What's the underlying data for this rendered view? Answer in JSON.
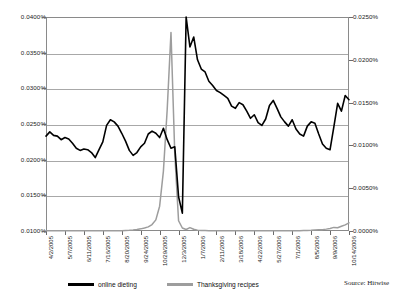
{
  "chart_data": {
    "type": "line",
    "title": "",
    "xlabel": "",
    "ylabel": "",
    "grid": true,
    "legend_position": "bottom",
    "source_note": "Source: Hitwise",
    "x_tick_labels": [
      "4/2/2005",
      "5/7/2005",
      "6/11/2005",
      "7/16/2005",
      "8/20/2005",
      "9/24/2005",
      "10/29/2005",
      "12/3/2005",
      "1/7/2006",
      "2/11/2006",
      "3/18/2006",
      "4/22/2006",
      "5/27/2006",
      "7/1/2006",
      "8/5/2006",
      "9/9/2006",
      "10/14/2006"
    ],
    "left_axis": {
      "label": "",
      "ylim": [
        0.01,
        0.04
      ],
      "tick_labels": [
        "0.0400%",
        "0.0350%",
        "0.0300%",
        "0.0250%",
        "0.0200%",
        "0.0150%",
        "0.0100%"
      ],
      "tick_values": [
        0.04,
        0.035,
        0.03,
        0.025,
        0.02,
        0.015,
        0.01
      ]
    },
    "right_axis": {
      "label": "",
      "ylim": [
        0.0,
        0.025
      ],
      "tick_labels": [
        "0.0250%",
        "0.0200%",
        "0.0150%",
        "0.0100%",
        "0.0050%",
        "0.0000%"
      ],
      "tick_values": [
        0.025,
        0.02,
        0.015,
        0.01,
        0.005,
        0.0
      ]
    },
    "series": [
      {
        "name": "online dieting",
        "color": "#000000",
        "axis": "left",
        "unit": "%",
        "x": [
          "4/2/2005",
          "4/9/2005",
          "4/16/2005",
          "4/23/2005",
          "4/30/2005",
          "5/7/2005",
          "5/14/2005",
          "5/21/2005",
          "5/28/2005",
          "6/4/2005",
          "6/11/2005",
          "6/18/2005",
          "6/25/2005",
          "7/2/2005",
          "7/9/2005",
          "7/16/2005",
          "7/23/2005",
          "7/30/2005",
          "8/6/2005",
          "8/13/2005",
          "8/20/2005",
          "8/27/2005",
          "9/3/2005",
          "9/10/2005",
          "9/17/2005",
          "9/24/2005",
          "10/1/2005",
          "10/8/2005",
          "10/15/2005",
          "10/22/2005",
          "10/29/2005",
          "11/5/2005",
          "11/12/2005",
          "11/19/2005",
          "11/26/2005",
          "12/3/2005",
          "12/10/2005",
          "12/17/2005",
          "12/24/2005",
          "12/31/2005",
          "1/7/2006",
          "1/14/2006",
          "1/21/2006",
          "1/28/2006",
          "2/4/2006",
          "2/11/2006",
          "2/18/2006",
          "2/25/2006",
          "3/4/2006",
          "3/11/2006",
          "3/18/2006",
          "3/25/2006",
          "4/1/2006",
          "4/8/2006",
          "4/15/2006",
          "4/22/2006",
          "4/29/2006",
          "5/6/2006",
          "5/13/2006",
          "5/20/2006",
          "5/27/2006",
          "6/3/2006",
          "6/10/2006",
          "6/17/2006",
          "6/24/2006",
          "7/1/2006",
          "7/8/2006",
          "7/15/2006",
          "7/22/2006",
          "7/29/2006",
          "8/5/2006",
          "8/12/2006",
          "8/19/2006",
          "8/26/2006",
          "9/2/2006",
          "9/9/2006",
          "9/16/2006",
          "9/23/2006",
          "9/30/2006",
          "10/7/2006",
          "10/14/2006"
        ],
        "values": [
          0.0233,
          0.0239,
          0.0234,
          0.0233,
          0.0228,
          0.0231,
          0.0229,
          0.0223,
          0.0216,
          0.0213,
          0.0215,
          0.0214,
          0.021,
          0.0203,
          0.0214,
          0.0225,
          0.0248,
          0.0256,
          0.0253,
          0.0247,
          0.0237,
          0.0226,
          0.0213,
          0.0206,
          0.021,
          0.0218,
          0.0223,
          0.0236,
          0.024,
          0.0237,
          0.0231,
          0.0244,
          0.0228,
          0.0216,
          0.0218,
          0.0148,
          0.0125,
          0.04,
          0.0358,
          0.0372,
          0.034,
          0.0327,
          0.0323,
          0.031,
          0.0304,
          0.0297,
          0.0294,
          0.029,
          0.0286,
          0.0275,
          0.0272,
          0.028,
          0.0277,
          0.0268,
          0.0258,
          0.0263,
          0.0252,
          0.0248,
          0.0257,
          0.0276,
          0.0283,
          0.0272,
          0.026,
          0.0253,
          0.0247,
          0.0256,
          0.0243,
          0.0236,
          0.0233,
          0.0247,
          0.0253,
          0.0251,
          0.0236,
          0.0222,
          0.0216,
          0.0214,
          0.0246,
          0.0279,
          0.0268,
          0.029,
          0.0284
        ]
      },
      {
        "name": "Thanksgiving recipes",
        "color": "#9d9d9d",
        "axis": "right",
        "unit": "%",
        "x": [
          "4/2/2005",
          "4/9/2005",
          "4/16/2005",
          "4/23/2005",
          "4/30/2005",
          "5/7/2005",
          "5/14/2005",
          "5/21/2005",
          "5/28/2005",
          "6/4/2005",
          "6/11/2005",
          "6/18/2005",
          "6/25/2005",
          "7/2/2005",
          "7/9/2005",
          "7/16/2005",
          "7/23/2005",
          "7/30/2005",
          "8/6/2005",
          "8/13/2005",
          "8/20/2005",
          "8/27/2005",
          "9/3/2005",
          "9/10/2005",
          "9/17/2005",
          "9/24/2005",
          "10/1/2005",
          "10/8/2005",
          "10/15/2005",
          "10/22/2005",
          "10/29/2005",
          "11/5/2005",
          "11/12/2005",
          "11/19/2005",
          "11/26/2005",
          "12/3/2005",
          "12/10/2005",
          "12/17/2005",
          "12/24/2005",
          "12/31/2005",
          "1/7/2006",
          "1/14/2006",
          "1/21/2006",
          "1/28/2006",
          "2/4/2006",
          "2/11/2006",
          "2/18/2006",
          "2/25/2006",
          "3/4/2006",
          "3/11/2006",
          "3/18/2006",
          "3/25/2006",
          "4/1/2006",
          "4/8/2006",
          "4/15/2006",
          "4/22/2006",
          "4/29/2006",
          "5/6/2006",
          "5/13/2006",
          "5/20/2006",
          "5/27/2006",
          "6/3/2006",
          "6/10/2006",
          "6/17/2006",
          "6/24/2006",
          "7/1/2006",
          "7/8/2006",
          "7/15/2006",
          "7/22/2006",
          "7/29/2006",
          "8/5/2006",
          "8/12/2006",
          "8/19/2006",
          "8/26/2006",
          "9/2/2006",
          "9/9/2006",
          "9/16/2006",
          "9/23/2006",
          "9/30/2006",
          "10/7/2006",
          "10/14/2006"
        ],
        "values": [
          2e-05,
          2e-05,
          2e-05,
          2e-05,
          2e-05,
          2e-05,
          2e-05,
          2e-05,
          2e-05,
          2e-05,
          2e-05,
          2e-05,
          2e-05,
          2e-05,
          2e-05,
          2e-05,
          2e-05,
          2e-05,
          2e-05,
          3e-05,
          4e-05,
          6e-05,
          8e-05,
          0.00012,
          0.00018,
          0.00025,
          0.00035,
          0.00048,
          0.00075,
          0.0013,
          0.0029,
          0.007,
          0.0142,
          0.0232,
          0.009,
          0.0012,
          0.00035,
          0.00018,
          0.0004,
          0.0002,
          0.0001,
          6e-05,
          5e-05,
          4e-05,
          4e-05,
          4e-05,
          4e-05,
          3e-05,
          3e-05,
          3e-05,
          3e-05,
          3e-05,
          3e-05,
          3e-05,
          3e-05,
          3e-05,
          3e-05,
          3e-05,
          3e-05,
          3e-05,
          3e-05,
          3e-05,
          3e-05,
          3e-05,
          3e-05,
          3e-05,
          4e-05,
          4e-05,
          5e-05,
          6e-05,
          8e-05,
          0.00011,
          0.00014,
          0.00016,
          0.00022,
          0.0003,
          0.00042,
          0.00038,
          0.00055,
          0.00072,
          0.00095
        ]
      }
    ]
  }
}
